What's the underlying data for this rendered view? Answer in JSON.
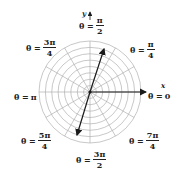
{
  "diagram": {
    "center": [
      90,
      92
    ],
    "outer_radius": 51,
    "circle_count": 8,
    "ray_step_degrees": 30,
    "colors": {
      "grid": "#b0b0b0",
      "arrow": "#1a1a1a",
      "text": "#222222"
    },
    "axes": {
      "x_label": "x",
      "y_label": "y"
    },
    "arrows": [
      {
        "name": "ray-theta-0",
        "to": [
          146,
          92
        ]
      },
      {
        "name": "ray-first-quadrant",
        "to": [
          104,
          49
        ]
      },
      {
        "name": "ray-third-quadrant",
        "to": [
          77,
          135
        ]
      }
    ],
    "labels": {
      "theta_0": {
        "eq": "θ =",
        "value": "0"
      },
      "theta_pi_over_4": {
        "eq": "θ =",
        "num": "π",
        "den": "4"
      },
      "theta_pi_over_2": {
        "eq": "θ =",
        "num": "π",
        "den": "2"
      },
      "theta_3pi_over_4": {
        "eq": "θ =",
        "num": "3π",
        "den": "4"
      },
      "theta_pi": {
        "eq": "θ =",
        "value": "π"
      },
      "theta_5pi_over_4": {
        "eq": "θ =",
        "num": "5π",
        "den": "4"
      },
      "theta_3pi_over_2": {
        "eq": "θ =",
        "num": "3π",
        "den": "2"
      },
      "theta_7pi_over_4": {
        "eq": "θ =",
        "num": "7π",
        "den": "4"
      }
    }
  }
}
